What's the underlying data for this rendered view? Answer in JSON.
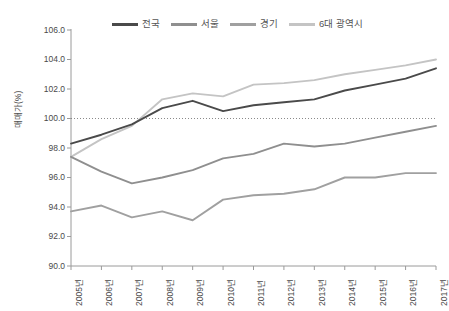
{
  "chart_data": {
    "type": "line",
    "title": "",
    "xlabel": "",
    "ylabel": "매매가(%)",
    "ylim": [
      90.0,
      106.0
    ],
    "ytick_step": 2.0,
    "yticks": [
      "106.0",
      "104.0",
      "102.0",
      "100.0",
      "98.0",
      "96.0",
      "94.0",
      "92.0",
      "90.0"
    ],
    "grid": false,
    "reference_line": {
      "value": 100.0,
      "style": "dotted",
      "color": "#8a8a8a"
    },
    "legend_position": "top",
    "categories": [
      "2005년",
      "2006년",
      "2007년",
      "2008년",
      "2009년",
      "2010년",
      "2011년",
      "2012년",
      "2013년",
      "2014년",
      "2015년",
      "2016년",
      "2017년"
    ],
    "series": [
      {
        "name": "전국",
        "color": "#4a4a4a",
        "values": [
          98.3,
          98.9,
          99.6,
          100.7,
          101.2,
          100.5,
          100.9,
          101.1,
          101.3,
          101.9,
          102.3,
          102.7,
          103.4
        ]
      },
      {
        "name": "서울",
        "color": "#8f8f8f",
        "values": [
          97.4,
          96.4,
          95.6,
          96.0,
          96.5,
          97.3,
          97.6,
          98.3,
          98.1,
          98.3,
          98.7,
          99.1,
          99.5
        ]
      },
      {
        "name": "경기",
        "color": "#a0a0a0",
        "values": [
          93.7,
          94.1,
          93.3,
          93.7,
          93.1,
          94.5,
          94.8,
          94.9,
          95.2,
          96.0,
          96.0,
          96.3,
          96.3
        ]
      },
      {
        "name": "6대 광역시",
        "color": "#c4c4c4",
        "values": [
          97.4,
          98.6,
          99.5,
          101.3,
          101.7,
          101.5,
          102.3,
          102.4,
          102.6,
          103.0,
          103.3,
          103.6,
          104.0
        ]
      }
    ]
  },
  "axis": {
    "y_title": "매매가(%)",
    "y_labels": [
      "106.0",
      "104.0",
      "102.0",
      "100.0",
      "98.0",
      "96.0",
      "94.0",
      "92.0",
      "90.0"
    ],
    "x_labels": [
      "2005년",
      "2006년",
      "2007년",
      "2008년",
      "2009년",
      "2010년",
      "2011년",
      "2012년",
      "2013년",
      "2014년",
      "2015년",
      "2016년",
      "2017년"
    ]
  },
  "legend": {
    "items": [
      {
        "label": "전국",
        "color": "#4a4a4a"
      },
      {
        "label": "서울",
        "color": "#8f8f8f"
      },
      {
        "label": "경기",
        "color": "#a0a0a0"
      },
      {
        "label": "6대 광역시",
        "color": "#c4c4c4"
      }
    ]
  }
}
